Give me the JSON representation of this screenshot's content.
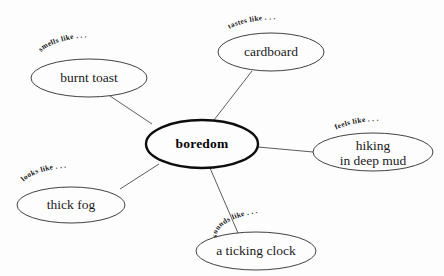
{
  "diagram": {
    "type": "radial-concept-map",
    "title_node": "boredom",
    "background_color": "#fdfdfd",
    "line_color": "#4a4a4a",
    "node_stroke_color": "#2b2b2b",
    "center_stroke_color": "#0d0d0d",
    "center": {
      "label": "boredom",
      "cx": 202,
      "cy": 144,
      "rx": 56,
      "ry": 24
    },
    "branches": [
      {
        "id": "smells",
        "relation": "smells like . . .",
        "label": "burnt toast",
        "label_line2": "",
        "cx": 89,
        "cy": 78,
        "rx": 58,
        "ry": 19,
        "edge": {
          "x1": 152,
          "y1": 124,
          "x2": 110,
          "y2": 96
        }
      },
      {
        "id": "tastes",
        "relation": "tastes like . . .",
        "label": "cardboard",
        "label_line2": "",
        "cx": 271,
        "cy": 52,
        "rx": 53,
        "ry": 19,
        "edge": {
          "x1": 214,
          "y1": 120,
          "x2": 252,
          "y2": 71
        }
      },
      {
        "id": "feels",
        "relation": "feels like . . .",
        "label": "hiking",
        "label_line2": "in deep mud",
        "cx": 373,
        "cy": 152,
        "rx": 60,
        "ry": 19,
        "edge": {
          "x1": 258,
          "y1": 147,
          "x2": 313,
          "y2": 152
        }
      },
      {
        "id": "sounds",
        "relation": "sounds like . . .",
        "label": "a ticking clock",
        "label_line2": "",
        "cx": 256,
        "cy": 251,
        "rx": 60,
        "ry": 19,
        "edge": {
          "x1": 210,
          "y1": 168,
          "x2": 238,
          "y2": 233
        }
      },
      {
        "id": "looks",
        "relation": "looks like . . .",
        "label": "thick fog",
        "label_line2": "",
        "cx": 71,
        "cy": 205,
        "rx": 54,
        "ry": 18,
        "edge": {
          "x1": 159,
          "y1": 164,
          "x2": 120,
          "y2": 189
        }
      }
    ]
  }
}
